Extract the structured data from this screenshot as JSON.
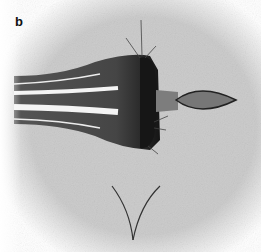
{
  "figure": {
    "panel_label": "b",
    "colors": {
      "background": "#c9c9c9",
      "body": "#4a4a4a",
      "front": "#1a1a1a",
      "tip": "#7a7a7a",
      "streak": "#f2f2f2"
    }
  }
}
